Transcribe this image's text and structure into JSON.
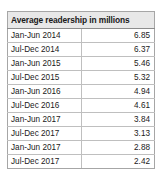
{
  "table": {
    "header_label": "Average readership in millions",
    "columns": [
      "Average readership in millions",
      ""
    ],
    "rows": [
      {
        "period": "Jan-Jun 2014",
        "value": "6.85"
      },
      {
        "period": "Jul-Dec 2014",
        "value": "6.37"
      },
      {
        "period": "Jan-Jun 2015",
        "value": "5.46"
      },
      {
        "period": "Jul-Dec 2015",
        "value": "5.32"
      },
      {
        "period": "Jan-Jun 2016",
        "value": "4.94"
      },
      {
        "period": "Jul-Dec 2016",
        "value": "4.61"
      },
      {
        "period": "Jan-Jun 2017",
        "value": "3.84"
      },
      {
        "period": "Jul-Dec 2017",
        "value": "3.13"
      },
      {
        "period": "Jan-Jun 2017",
        "value": "2.88"
      },
      {
        "period": "Jul-Dec 2017",
        "value": "2.42"
      }
    ],
    "colors": {
      "header_background": "#e8e8e8",
      "header_text": "#1a1a1a",
      "grid_line": "#bfbfbf",
      "outer_border": "#a6a6a6",
      "page_background": "#ffffff"
    }
  },
  "chart_data": {
    "type": "table",
    "title": "Average readership in millions",
    "categories": [
      "Jan-Jun 2014",
      "Jul-Dec 2014",
      "Jan-Jun 2015",
      "Jul-Dec 2015",
      "Jan-Jun 2016",
      "Jul-Dec 2016",
      "Jan-Jun 2017",
      "Jul-Dec 2017",
      "Jan-Jun 2017",
      "Jul-Dec 2017"
    ],
    "values": [
      6.85,
      6.37,
      5.46,
      5.32,
      4.94,
      4.61,
      3.84,
      3.13,
      2.88,
      2.42
    ],
    "xlabel": "",
    "ylabel": "Average readership in millions"
  }
}
